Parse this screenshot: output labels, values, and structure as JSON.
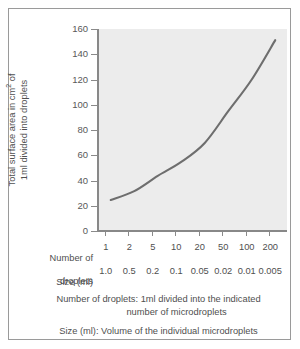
{
  "chart_data": {
    "type": "line",
    "title": "",
    "xlabel": "Number of droplets",
    "ylabel": "Total surface area in cm2 of 1ml divided into droplets",
    "ylim": [
      0,
      160
    ],
    "yticks": [
      0,
      20,
      40,
      60,
      80,
      100,
      120,
      140,
      160
    ],
    "grid": false,
    "legend": "none",
    "categories": [
      "1",
      "2",
      "5",
      "10",
      "20",
      "50",
      "100",
      "200"
    ],
    "x_secondary_label": "Size (ml)",
    "x_secondary": [
      "1.0",
      "0.5",
      "0.2",
      "0.1",
      "0.05",
      "0.02",
      "0.01",
      "0.005"
    ],
    "series": [
      {
        "name": "Total surface area",
        "values": [
          26,
          33,
          45,
          56,
          71,
          96,
          121,
          152
        ]
      }
    ],
    "line_color": "#6e6e6e",
    "plot_background": "#ececec"
  },
  "axes": {
    "y_label_line1": "Total surface area in cm",
    "y_label_sup": "2",
    "y_label_line1_end": " of",
    "y_label_line2": "1ml divided into droplets",
    "y_ticks": [
      "160",
      "140",
      "120",
      "100",
      "80",
      "60",
      "40",
      "20",
      "0"
    ],
    "row_label_droplets_line1": "Number of",
    "row_label_droplets_line2": "droplets",
    "row_label_size": "Size (ml)",
    "droplet_counts": [
      "1",
      "2",
      "5",
      "10",
      "20",
      "50",
      "100",
      "200"
    ],
    "droplet_sizes": [
      "1.0",
      "0.5",
      "0.2",
      "0.1",
      "0.05",
      "0.02",
      "0.01",
      "0.005"
    ]
  },
  "footnotes": {
    "note1_line1": "Number of droplets: 1ml divided into the indicated",
    "note1_line2": "number of microdroplets",
    "note2": "Size (ml): Volume of the individual microdroplets"
  }
}
